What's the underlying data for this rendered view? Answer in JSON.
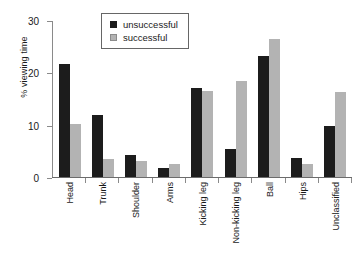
{
  "chart_data": {
    "type": "bar",
    "title": "",
    "xlabel": "",
    "ylabel": "% viewing time",
    "ylim": [
      0,
      30
    ],
    "yticks": [
      0,
      10,
      20,
      30
    ],
    "grid": false,
    "legend_position": "top-center",
    "categories": [
      "Head",
      "Trunk",
      "Shoulder",
      "Arms",
      "Kicking leg",
      "Non-kicking leg",
      "Ball",
      "Hips",
      "Unclassified"
    ],
    "series": [
      {
        "name": "unsuccessful",
        "color": "#1c1c1c",
        "values": [
          21.5,
          11.9,
          4.3,
          1.8,
          17.1,
          5.3,
          23.2,
          3.7,
          9.8
        ]
      },
      {
        "name": "successful",
        "color": "#b3b3b3",
        "values": [
          10.2,
          3.5,
          3.1,
          2.5,
          16.5,
          18.3,
          26.3,
          2.4,
          16.2
        ]
      }
    ]
  }
}
